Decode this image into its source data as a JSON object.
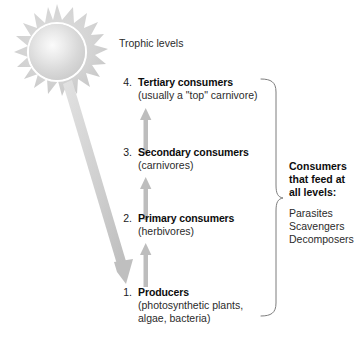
{
  "diagram": {
    "heading": "Trophic levels",
    "sun": {
      "icon": "sun-icon",
      "color": "#d4d4d4"
    },
    "energy_arrow": {
      "icon": "diagonal-arrow-icon",
      "color": "#cfcfcf"
    },
    "flow_arrow_color": "#bdbdbd",
    "levels": [
      {
        "number": "4.",
        "title": "Tertiary consumers",
        "subtitle": "(usually a \"top\" carnivore)"
      },
      {
        "number": "3.",
        "title": "Secondary consumers",
        "subtitle": "(carnivores)"
      },
      {
        "number": "2.",
        "title": "Primary consumers",
        "subtitle": "(herbivores)"
      },
      {
        "number": "1.",
        "title": "Producers",
        "subtitle_line1": "(photosynthetic plants,",
        "subtitle_line2": "algae, bacteria)"
      }
    ],
    "side_note": {
      "brace": "curly-brace-icon",
      "title_line1": "Consumers",
      "title_line2": "that feed at",
      "title_line3": "all levels:",
      "items": [
        "Parasites",
        "Scavengers",
        "Decomposers"
      ]
    }
  }
}
